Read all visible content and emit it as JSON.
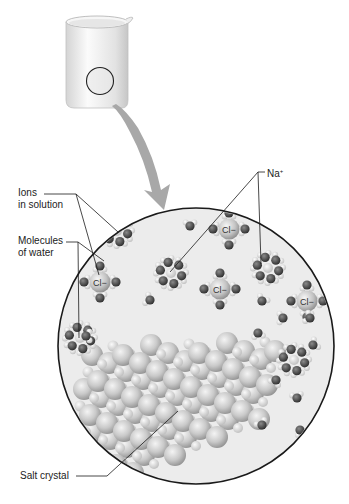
{
  "labels": {
    "ions": {
      "line1": "Ions",
      "line2": "in solution"
    },
    "water": {
      "line1": "Molecules",
      "line2": "of water"
    },
    "sodium": {
      "symbol": "Na",
      "charge": "+"
    },
    "crystal": "Salt crystal"
  },
  "ions": {
    "chloride_label": "Cl−",
    "chloride_positions": [
      [
        100,
        282
      ],
      [
        229,
        229
      ],
      [
        220,
        289
      ],
      [
        307,
        301
      ]
    ],
    "sodium_positions": [
      [
        171,
        273
      ],
      [
        268,
        268
      ],
      [
        294,
        360
      ],
      [
        80,
        338
      ],
      [
        117,
        231
      ]
    ]
  },
  "figure": {
    "beaker": {
      "x": 63,
      "y": 13,
      "w": 67,
      "h": 95
    },
    "zoom_circle": {
      "cx": 196,
      "cy": 346,
      "r": 138
    },
    "beaker_marker": {
      "cx": 100,
      "cy": 81,
      "r": 14
    }
  },
  "colors": {
    "circle_fill": "#ececec",
    "outline": "#1a1a1a",
    "arrow": "#a8a8a8",
    "sphere_large": "#c8c8c8",
    "sphere_small": "#dedede",
    "oxygen": "#454545",
    "hydrogen": "#d6d6d6"
  }
}
